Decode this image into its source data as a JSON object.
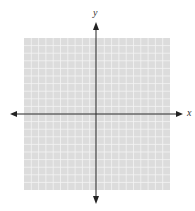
{
  "diagram": {
    "type": "coordinate-plane",
    "x_axis_label": "x",
    "y_axis_label": "y",
    "grid": {
      "columns": 20,
      "rows": 20,
      "origin_col": 10,
      "origin_row": 10
    },
    "colors": {
      "grid_bg": "#dcdcdc",
      "grid_line": "#f4f4f4",
      "axis": "#222222"
    }
  },
  "chart_data": {
    "type": "scatter",
    "title": "",
    "xlabel": "x",
    "ylabel": "y",
    "xlim": [
      -10,
      10
    ],
    "ylim": [
      -10,
      10
    ],
    "grid": true,
    "series": [],
    "tick_labels": []
  }
}
